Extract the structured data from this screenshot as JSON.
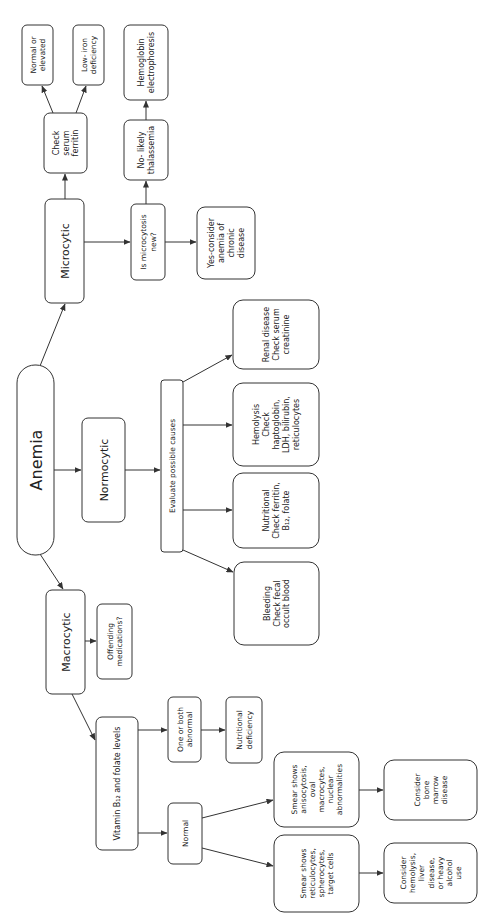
{
  "diagram": {
    "orientation": "rotated-90-ccw",
    "colors": {
      "stroke": "#333333",
      "text": "#222222",
      "background": "#ffffff"
    },
    "nodes": [
      {
        "id": "anemia",
        "lines": [
          "Anemia"
        ],
        "x": 17,
        "y": 365,
        "w": 37,
        "h": 190,
        "rx": 18,
        "fs": 16
      },
      {
        "id": "microcytic",
        "lines": [
          "Microcytic"
        ],
        "x": 45,
        "y": 199,
        "w": 39,
        "h": 104,
        "rx": 6,
        "fs": 11
      },
      {
        "id": "normocytic",
        "lines": [
          "Normocytic"
        ],
        "x": 82,
        "y": 418,
        "w": 43,
        "h": 104,
        "rx": 6,
        "fs": 11
      },
      {
        "id": "macrocytic",
        "lines": [
          "Macrocytic"
        ],
        "x": 46,
        "y": 590,
        "w": 39,
        "h": 104,
        "rx": 6,
        "fs": 11
      },
      {
        "id": "check-serum-ferritin",
        "lines": [
          "Check",
          "serum",
          "ferritin"
        ],
        "x": 44,
        "y": 113,
        "w": 43,
        "h": 60,
        "rx": 6,
        "fs": 8
      },
      {
        "id": "normal-or-elevated",
        "lines": [
          "Normal or",
          "elevated"
        ],
        "x": 22,
        "y": 25,
        "w": 31,
        "h": 60,
        "rx": 5,
        "fs": 7.5
      },
      {
        "id": "low-iron-deficiency",
        "lines": [
          "Low- iron",
          "deficiency"
        ],
        "x": 73,
        "y": 25,
        "w": 31,
        "h": 60,
        "rx": 5,
        "fs": 7.5
      },
      {
        "id": "is-microcytosis-new",
        "lines": [
          "Is microcytosis",
          "new?"
        ],
        "x": 131,
        "y": 204,
        "w": 34,
        "h": 76,
        "rx": 5,
        "fs": 7.5
      },
      {
        "id": "no-likely-thalassemia",
        "lines": [
          "No- likely",
          "thalassemia"
        ],
        "x": 124,
        "y": 120,
        "w": 44,
        "h": 60,
        "rx": 6,
        "fs": 8
      },
      {
        "id": "hemoglobin-electrophoresis",
        "lines": [
          "Hemoglobin",
          "electrophoresis"
        ],
        "x": 124,
        "y": 25,
        "w": 44,
        "h": 75,
        "rx": 6,
        "fs": 8
      },
      {
        "id": "yes-anemia-chronic-disease",
        "lines": [
          "Yes-consider",
          "anemia of",
          "chronic",
          "disease"
        ],
        "x": 197,
        "y": 207,
        "w": 58,
        "h": 72,
        "rx": 8,
        "fs": 8
      },
      {
        "id": "evaluate-possible-causes",
        "lines": [
          "Evaluate possible causes"
        ],
        "x": 161,
        "y": 380,
        "w": 22,
        "h": 172,
        "rx": 3,
        "fs": 7.5
      },
      {
        "id": "renal-disease",
        "lines": [
          "Renal disease",
          "Check serum",
          "creatinine"
        ],
        "x": 233,
        "y": 300,
        "w": 86,
        "h": 69,
        "rx": 10,
        "fs": 8
      },
      {
        "id": "hemolysis",
        "lines": [
          "Hemolysis",
          "Check",
          "haptoglobin,",
          "LDH, bilirubin,",
          "reticulocytes"
        ],
        "x": 233,
        "y": 383,
        "w": 86,
        "h": 83,
        "rx": 10,
        "fs": 8
      },
      {
        "id": "nutritional",
        "lines": [
          "Nutritional",
          "Check ferritin,",
          "B₁₂, folate"
        ],
        "x": 233,
        "y": 473,
        "w": 86,
        "h": 75,
        "rx": 10,
        "fs": 8
      },
      {
        "id": "bleeding",
        "lines": [
          "Bleeding",
          "Check fecal",
          "occult blood"
        ],
        "x": 234,
        "y": 562,
        "w": 85,
        "h": 83,
        "rx": 10,
        "fs": 8
      },
      {
        "id": "offending-medications",
        "lines": [
          "Offending",
          "medications?"
        ],
        "x": 97,
        "y": 604,
        "w": 35,
        "h": 75,
        "rx": 5,
        "fs": 7.5
      },
      {
        "id": "vitamin-b12-folate",
        "lines": [
          "Vitamin B₁₂ and folate levels"
        ],
        "x": 96,
        "y": 717,
        "w": 42,
        "h": 133,
        "rx": 6,
        "fs": 8
      },
      {
        "id": "one-or-both-abnormal",
        "lines": [
          "One or both",
          "abnormal"
        ],
        "x": 168,
        "y": 697,
        "w": 33,
        "h": 65,
        "rx": 5,
        "fs": 7.5
      },
      {
        "id": "nutritional-deficiency",
        "lines": [
          "Nutritional",
          "deficiency"
        ],
        "x": 226,
        "y": 697,
        "w": 36,
        "h": 66,
        "rx": 5,
        "fs": 7.5
      },
      {
        "id": "normal",
        "lines": [
          "Normal"
        ],
        "x": 168,
        "y": 803,
        "w": 34,
        "h": 61,
        "rx": 5,
        "fs": 7.5
      },
      {
        "id": "smear-anisocytosis",
        "lines": [
          "Smear shows",
          "anisocytosis,",
          "oval",
          "macrocytes,",
          "nuclear",
          "abnormalities"
        ],
        "x": 274,
        "y": 752,
        "w": 85,
        "h": 75,
        "rx": 10,
        "fs": 7.5
      },
      {
        "id": "consider-bone-marrow",
        "lines": [
          "Consider",
          "bone",
          "marrow",
          "disease"
        ],
        "x": 384,
        "y": 760,
        "w": 93,
        "h": 60,
        "rx": 10,
        "fs": 7.5
      },
      {
        "id": "smear-reticulocytes",
        "lines": [
          "Smear shows",
          "reticulocytes,",
          "spherocytes,",
          "target cells"
        ],
        "x": 274,
        "y": 835,
        "w": 85,
        "h": 77,
        "rx": 10,
        "fs": 7.5
      },
      {
        "id": "consider-hemolysis-liver-alcohol",
        "lines": [
          "Consider",
          "hemolysis,",
          "liver",
          "disease,",
          "or heavy",
          "alcohol",
          "use"
        ],
        "x": 384,
        "y": 843,
        "w": 93,
        "h": 60,
        "rx": 10,
        "fs": 7.5
      }
    ],
    "edges": [
      {
        "from": "anemia",
        "to": "microcytic",
        "pts": [
          [
            40,
            366
          ],
          [
            65,
            304
          ]
        ]
      },
      {
        "from": "anemia",
        "to": "normocytic",
        "pts": [
          [
            54,
            470
          ],
          [
            81,
            470
          ]
        ]
      },
      {
        "from": "anemia",
        "to": "macrocytic",
        "pts": [
          [
            40,
            554
          ],
          [
            63,
            589
          ]
        ]
      },
      {
        "from": "microcytic",
        "to": "check-serum-ferritin",
        "pts": [
          [
            65,
            199
          ],
          [
            65,
            174
          ]
        ]
      },
      {
        "from": "check-serum-ferritin",
        "to": "normal-or-elevated",
        "pts": [
          [
            53,
            113
          ],
          [
            42,
            86
          ]
        ]
      },
      {
        "from": "check-serum-ferritin",
        "to": "low-iron-deficiency",
        "pts": [
          [
            76,
            113
          ],
          [
            86,
            86
          ]
        ]
      },
      {
        "from": "microcytic",
        "to": "is-microcytosis-new",
        "pts": [
          [
            84,
            242
          ],
          [
            130,
            242
          ]
        ]
      },
      {
        "from": "is-microcytosis-new",
        "to": "no-likely-thalassemia",
        "pts": [
          [
            146,
            204
          ],
          [
            146,
            181
          ]
        ]
      },
      {
        "from": "no-likely-thalassemia",
        "to": "hemoglobin-electrophoresis",
        "pts": [
          [
            146,
            120
          ],
          [
            146,
            101
          ]
        ]
      },
      {
        "from": "is-microcytosis-new",
        "to": "yes-anemia-chronic-disease",
        "pts": [
          [
            165,
            242
          ],
          [
            196,
            242
          ]
        ]
      },
      {
        "from": "normocytic",
        "to": "evaluate-possible-causes",
        "pts": [
          [
            125,
            470
          ],
          [
            160,
            470
          ]
        ]
      },
      {
        "from": "evaluate-possible-causes",
        "to": "renal-disease",
        "pts": [
          [
            183,
            382
          ],
          [
            232,
            355
          ]
        ]
      },
      {
        "from": "evaluate-possible-causes",
        "to": "hemolysis",
        "pts": [
          [
            183,
            425
          ],
          [
            232,
            425
          ]
        ]
      },
      {
        "from": "evaluate-possible-causes",
        "to": "nutritional",
        "pts": [
          [
            183,
            510
          ],
          [
            232,
            510
          ]
        ]
      },
      {
        "from": "evaluate-possible-causes",
        "to": "bleeding",
        "pts": [
          [
            183,
            550
          ],
          [
            233,
            572
          ]
        ]
      },
      {
        "from": "macrocytic",
        "to": "offending-medications",
        "pts": [
          [
            85,
            641
          ],
          [
            96,
            641
          ]
        ]
      },
      {
        "from": "macrocytic",
        "to": "vitamin-b12-folate",
        "pts": [
          [
            72,
            694
          ],
          [
            95,
            740
          ]
        ]
      },
      {
        "from": "vitamin-b12-folate",
        "to": "one-or-both-abnormal",
        "pts": [
          [
            138,
            730
          ],
          [
            167,
            730
          ]
        ]
      },
      {
        "from": "one-or-both-abnormal",
        "to": "nutritional-deficiency",
        "pts": [
          [
            201,
            730
          ],
          [
            225,
            730
          ]
        ]
      },
      {
        "from": "vitamin-b12-folate",
        "to": "normal",
        "pts": [
          [
            138,
            833
          ],
          [
            167,
            833
          ]
        ]
      },
      {
        "from": "normal",
        "to": "smear-anisocytosis",
        "pts": [
          [
            202,
            818
          ],
          [
            273,
            800
          ]
        ]
      },
      {
        "from": "normal",
        "to": "smear-reticulocytes",
        "pts": [
          [
            202,
            848
          ],
          [
            273,
            866
          ]
        ]
      },
      {
        "from": "smear-anisocytosis",
        "to": "consider-bone-marrow",
        "pts": [
          [
            359,
            790
          ],
          [
            383,
            790
          ]
        ]
      },
      {
        "from": "smear-reticulocytes",
        "to": "consider-hemolysis-liver-alcohol",
        "pts": [
          [
            359,
            873
          ],
          [
            383,
            873
          ]
        ]
      }
    ]
  }
}
